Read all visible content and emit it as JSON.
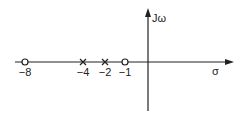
{
  "diagram": {
    "type": "pole-zero plot (s-plane)",
    "axes": {
      "vertical_label": "Jω",
      "horizontal_label": "σ"
    },
    "zeros": [
      {
        "position": -8,
        "label": "−8",
        "marker": "o"
      },
      {
        "position": -1,
        "label": "−1",
        "marker": "o"
      }
    ],
    "poles": [
      {
        "position": -4,
        "label": "−4",
        "marker": "x"
      },
      {
        "position": -2,
        "label": "−2",
        "marker": "x"
      }
    ],
    "colors": {
      "stroke": "#222222",
      "background": "#ffffff"
    }
  }
}
